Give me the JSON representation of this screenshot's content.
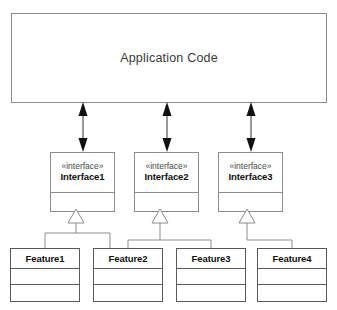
{
  "diagram": {
    "background_color": "#ffffff",
    "line_color": "#8c8c8c",
    "text_color": "#101010"
  },
  "application": {
    "label": "Application Code"
  },
  "interfaces": [
    {
      "stereotype": "«interface»",
      "name": "Interface1"
    },
    {
      "stereotype": "«interface»",
      "name": "Interface2"
    },
    {
      "stereotype": "«interface»",
      "name": "Interface3"
    }
  ],
  "features": [
    {
      "name": "Feature1"
    },
    {
      "name": "Feature2"
    },
    {
      "name": "Feature3"
    },
    {
      "name": "Feature4"
    }
  ],
  "connectors": {
    "dependency_arrow": "double-headed-solid-arrow",
    "realization_arrow": "hollow-triangle-arrow"
  }
}
